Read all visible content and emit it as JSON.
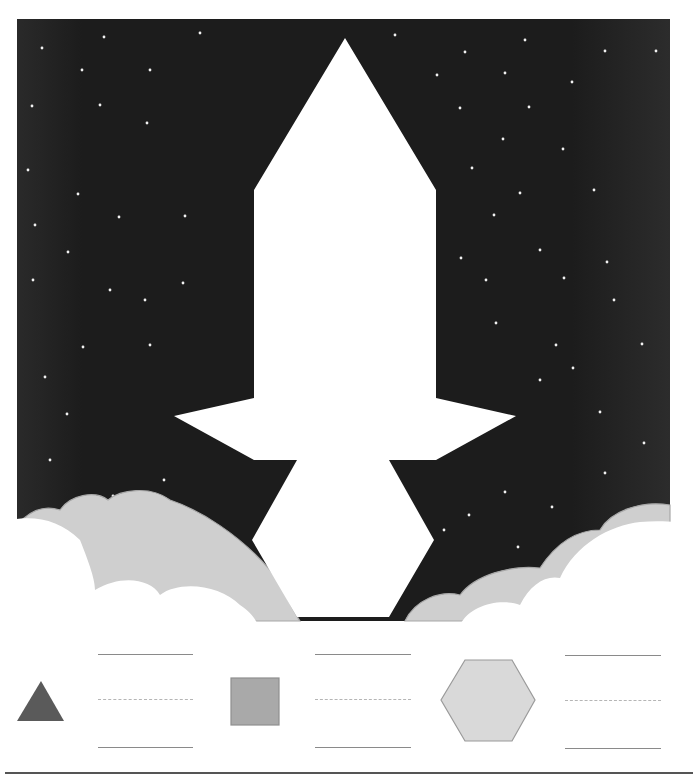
{
  "worksheet": {
    "title": "Rocket pattern block puzzle",
    "scene": {
      "sky_color": "#1c1c1c",
      "star_color": "#f2f2f2",
      "rocket_color": "#ffffff",
      "cloud_back_color": "#cfcfcf",
      "cloud_front_color": "#ffffff",
      "cloud_outline_color": "#a8a8a8"
    },
    "key": {
      "shapes": [
        {
          "name": "triangle",
          "color": "#5a5a5a",
          "answer": ""
        },
        {
          "name": "square",
          "color": "#a9a9a9",
          "answer": ""
        },
        {
          "name": "hexagon",
          "color": "#d9d9d9",
          "answer": ""
        }
      ]
    }
  }
}
